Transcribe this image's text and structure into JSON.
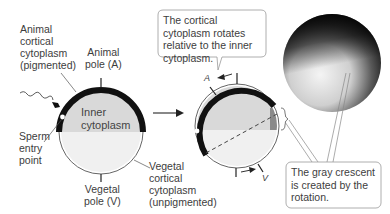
{
  "labels": {
    "animal_cortical": [
      "Animal",
      "cortical",
      "cytoplasm",
      "(pigmented)"
    ],
    "animal_pole": [
      "Animal",
      "pole (A)"
    ],
    "inner_cytoplasm": [
      "Inner",
      "cytoplasm"
    ],
    "sperm_entry": [
      "Sperm",
      "entry",
      "point"
    ],
    "vegetal_pole": [
      "Vegetal",
      "pole (V)"
    ],
    "vegetal_cortical": [
      "Vegetal",
      "cortical",
      "cytoplasm",
      "(unpigmented)"
    ],
    "rotation_A": "A",
    "rotation_V": "V"
  },
  "callouts": {
    "rotation": "The cortical cytoplasm rotates relative to the inner cytoplasm.",
    "gray_crescent": "The gray crescent is created by the rotation."
  },
  "colors": {
    "cortex_pigmented": "#111111",
    "inner_upper": "#d9d9d9",
    "inner_lower": "#efefef",
    "gray_crescent": "#8a8a8a",
    "outline": "#555555"
  }
}
